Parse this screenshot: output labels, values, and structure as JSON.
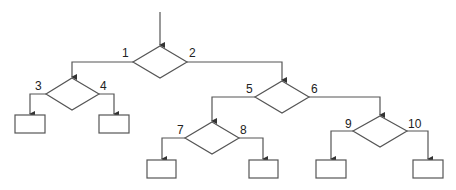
{
  "diagram": {
    "type": "decision-tree",
    "colors": {
      "line": "#555555",
      "background": "#ffffff",
      "text": "#222222"
    },
    "decisions": [
      {
        "id": "d1",
        "left_label": "1",
        "right_label": "2"
      },
      {
        "id": "d2",
        "left_label": "3",
        "right_label": "4"
      },
      {
        "id": "d3",
        "left_label": "5",
        "right_label": "6"
      },
      {
        "id": "d4",
        "left_label": "7",
        "right_label": "8"
      },
      {
        "id": "d5",
        "left_label": "9",
        "right_label": "10"
      }
    ],
    "leaf_count": 6,
    "edges": [
      {
        "from": "entry",
        "to": "d1"
      },
      {
        "from": "d1",
        "branch": "1",
        "to": "d2"
      },
      {
        "from": "d1",
        "branch": "2",
        "to": "d3"
      },
      {
        "from": "d2",
        "branch": "3",
        "to": "leaf1"
      },
      {
        "from": "d2",
        "branch": "4",
        "to": "leaf2"
      },
      {
        "from": "d3",
        "branch": "5",
        "to": "d4"
      },
      {
        "from": "d3",
        "branch": "6",
        "to": "d5"
      },
      {
        "from": "d4",
        "branch": "7",
        "to": "leaf3"
      },
      {
        "from": "d4",
        "branch": "8",
        "to": "leaf4"
      },
      {
        "from": "d5",
        "branch": "9",
        "to": "leaf5"
      },
      {
        "from": "d5",
        "branch": "10",
        "to": "leaf6"
      }
    ]
  }
}
